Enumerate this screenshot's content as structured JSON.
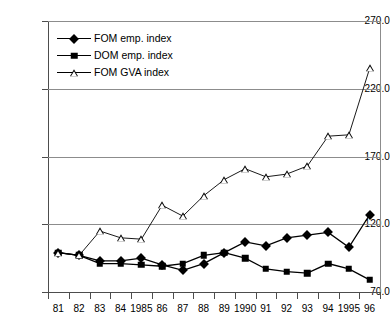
{
  "chart_data": {
    "type": "line",
    "title": "",
    "xlabel": "",
    "ylabel": "",
    "ylim": [
      70.0,
      270.0
    ],
    "yticks": [
      "70.0",
      "120.0",
      "170.0",
      "220.0",
      "270.0"
    ],
    "ytick_values": [
      70.0,
      120.0,
      170.0,
      220.0,
      270.0
    ],
    "grid": true,
    "legend_position": "top-left-inside",
    "categories": [
      "81",
      "82",
      "83",
      "84",
      "1985",
      "86",
      "87",
      "88",
      "89",
      "1990",
      "91",
      "92",
      "93",
      "94",
      "1995",
      "96"
    ],
    "x_values": [
      1981,
      1982,
      1983,
      1984,
      1985,
      1986,
      1987,
      1988,
      1989,
      1990,
      1991,
      1992,
      1993,
      1994,
      1995,
      1996
    ],
    "series": [
      {
        "name": "FOM emp. index",
        "marker": "filled-diamond",
        "color": "#000000",
        "values": [
          99,
          97,
          93,
          93,
          95,
          90,
          86,
          91,
          99,
          107,
          104,
          110,
          112,
          114,
          103,
          127
        ]
      },
      {
        "name": "DOM emp. index",
        "marker": "filled-square",
        "color": "#000000",
        "values": [
          99,
          97,
          91,
          91,
          90,
          89,
          91,
          97,
          99,
          95,
          87,
          85,
          84,
          91,
          87,
          79
        ]
      },
      {
        "name": "FOM GVA index",
        "marker": "open-triangle",
        "color": "#000000",
        "values": [
          99,
          97,
          115,
          110,
          109,
          134,
          126,
          141,
          153,
          161,
          155,
          157,
          163,
          185,
          186,
          235
        ]
      }
    ]
  },
  "legend": {
    "items": [
      {
        "label": "FOM emp. index",
        "marker": "filled-diamond"
      },
      {
        "label": "DOM emp. index",
        "marker": "filled-square"
      },
      {
        "label": "FOM GVA index",
        "marker": "open-triangle"
      }
    ]
  },
  "axes": {
    "y_labels": [
      "270.0",
      "220.0",
      "170.0",
      "120.0",
      "70.0"
    ],
    "x_labels": [
      "81",
      "82",
      "83",
      "84",
      "1985",
      "86",
      "87",
      "88",
      "89",
      "1990",
      "91",
      "92",
      "93",
      "94",
      "1995",
      "96"
    ]
  },
  "colors": {
    "grid": "#8c8c8c",
    "axis": "#4d4d4d",
    "series": "#000000",
    "background": "#ffffff"
  }
}
